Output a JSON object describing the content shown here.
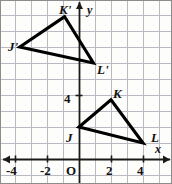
{
  "figure": {
    "kind": "coordinate-plane-geometry",
    "background_color": "#fdfdfb",
    "border_color": "#8c8c8c",
    "grid_color": "#b9b9c4",
    "axis_color": "#1a1a1a",
    "shape_color": "#000000",
    "grid_spacing_px": 16,
    "origin_px": {
      "x": 79,
      "y": 159
    }
  },
  "axes": {
    "x_label": "x",
    "y_label": "y",
    "origin_label": "O",
    "x_ticks": [
      {
        "label": "-4",
        "value": -4
      },
      {
        "label": "-2",
        "value": -2
      },
      {
        "label": "2",
        "value": 2
      },
      {
        "label": "4",
        "value": 4
      }
    ],
    "y_ticks": [
      {
        "label": "4",
        "value": 4
      }
    ],
    "x_range": [
      -5,
      5.6
    ],
    "y_range": [
      -0.3,
      9.9
    ]
  },
  "chart_data": {
    "type": "scatter",
    "title": "",
    "xlabel": "x",
    "ylabel": "y",
    "xlim": [
      -5,
      5.6
    ],
    "ylim": [
      -0.3,
      9.9
    ],
    "grid": true,
    "series": [
      {
        "name": "Triangle JKL",
        "closed": true,
        "points": [
          {
            "label": "J",
            "x": 0,
            "y": 2
          },
          {
            "label": "K",
            "x": 2,
            "y": 3.7
          },
          {
            "label": "L",
            "x": 4,
            "y": 1
          }
        ]
      },
      {
        "name": "Triangle J'K'L'",
        "closed": true,
        "points": [
          {
            "label": "K'",
            "x": -0.9,
            "y": 8.9
          },
          {
            "label": "J'",
            "x": -3.7,
            "y": 7
          },
          {
            "label": "L'",
            "x": 0.9,
            "y": 6
          }
        ]
      }
    ]
  },
  "vertex_labels": [
    {
      "name": "K'",
      "left": 59,
      "top": 3
    },
    {
      "name": "J'",
      "left": 8,
      "top": 40
    },
    {
      "name": "L'",
      "left": 97,
      "top": 63
    },
    {
      "name": "K",
      "left": 113,
      "top": 87
    },
    {
      "name": "J",
      "left": 66,
      "top": 131
    },
    {
      "name": "L",
      "left": 151,
      "top": 131
    }
  ],
  "axis_labels": [
    {
      "name": "y",
      "left": 87,
      "top": 4
    },
    {
      "name": "x",
      "left": 155,
      "top": 143
    }
  ],
  "tick_labels": [
    {
      "name": "-4",
      "left": 6,
      "top": 164
    },
    {
      "name": "-2",
      "left": 40,
      "top": 164
    },
    {
      "name": "O",
      "left": 66,
      "top": 164
    },
    {
      "name": "2",
      "left": 106,
      "top": 164
    },
    {
      "name": "4",
      "left": 137,
      "top": 164
    },
    {
      "name": "4",
      "left": 64,
      "top": 92
    }
  ]
}
